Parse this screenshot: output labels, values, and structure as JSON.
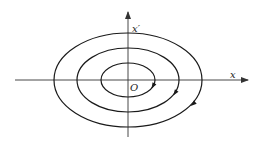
{
  "diagram": {
    "stroke_color": "#1a1a1a",
    "axis_color": "#333333",
    "axes": {
      "x_label": "x",
      "y_label": "x′",
      "origin_label": "O"
    },
    "center": [
      128,
      80
    ],
    "ellipses": [
      {
        "name": "inner",
        "rx": 27,
        "ry": 17,
        "arrow_direction": "clockwise"
      },
      {
        "name": "middle",
        "rx": 51,
        "ry": 32,
        "arrow_direction": "clockwise"
      },
      {
        "name": "outer",
        "rx": 74,
        "ry": 47,
        "arrow_direction": "clockwise"
      }
    ]
  }
}
